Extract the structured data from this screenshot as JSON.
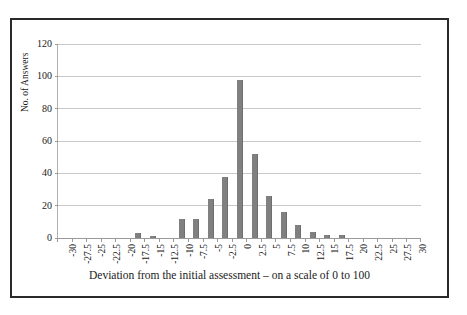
{
  "chart_data": {
    "type": "bar",
    "title": "",
    "subtitle": "",
    "xlabel": "Deviation from the initial assessment – on a scale of 0 to 100",
    "ylabel": "No. of Answers",
    "categories": [
      "-30",
      "-27.5",
      "-25",
      "-22.5",
      "-20",
      "-17.5",
      "-15",
      "-12.5",
      "-10",
      "-7.5",
      "-5",
      "-2.5",
      "0",
      "2.5",
      "5",
      "7.5",
      "10",
      "12.5",
      "15",
      "17.5",
      "20",
      "22.5",
      "25",
      "27.5",
      "30"
    ],
    "values": [
      0,
      0,
      0,
      0,
      0,
      3,
      1.5,
      0,
      12,
      12,
      24,
      38,
      98,
      52,
      26,
      16,
      8,
      4,
      2,
      2,
      0,
      0,
      0,
      0,
      0
    ],
    "ylim": [
      0,
      120
    ],
    "yticks": [
      "0",
      "20",
      "40",
      "60",
      "80",
      "100",
      "120"
    ],
    "ytick_values": [
      0,
      20,
      40,
      60,
      80,
      100,
      120
    ],
    "grid": true,
    "legend": false,
    "legend_position": "none",
    "bar_color": "#808080",
    "gridline_color": "#c9c9c9",
    "axis_color": "#9a9a9a",
    "frame_color": "#2a2a2a",
    "background": "#ffffff"
  }
}
